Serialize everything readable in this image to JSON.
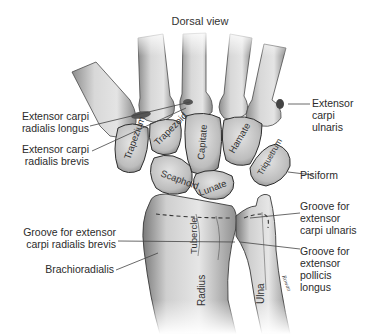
{
  "figure": {
    "title": "Dorsal view"
  },
  "labels_left": [
    {
      "id": "ecrl",
      "line1": "Extensor carpi",
      "line2": "radialis longus"
    },
    {
      "id": "ecrb",
      "line1": "Extensor carpi",
      "line2": "radialis brevis"
    },
    {
      "id": "groove_ecrb",
      "line1": "Groove for extensor",
      "line2": "carpi radialis brevis"
    },
    {
      "id": "brachioradialis",
      "line1": "Brachioradialis"
    }
  ],
  "labels_right": [
    {
      "id": "ecu",
      "line1": "Extensor",
      "line2": "carpi",
      "line3": "ulnaris"
    },
    {
      "id": "pisiform",
      "line1": "Pisiform"
    },
    {
      "id": "groove_ecu",
      "line1": "Groove for",
      "line2": "extensor",
      "line3": "carpi ulnaris"
    },
    {
      "id": "groove_epl",
      "line1": "Groove for",
      "line2": "extensor",
      "line3": "pollicis",
      "line4": "longus"
    }
  ],
  "bone_labels": {
    "trapezium": "Trapezium",
    "trapezoid": "Trapezoid",
    "capitate": "Capitate",
    "hamate": "Hamate",
    "triquetrum": "Triquetrum",
    "scaphoid": "Scaphoid",
    "lunate": "Lunate",
    "tubercle": "Tubercle",
    "radius": "Radius",
    "ulna": "Ulna"
  },
  "signature": "Rowan",
  "colors": {
    "bone_fill": "#d9d9d9",
    "bone_shade": "#9a9a9a",
    "outline": "#3a3a3a",
    "leader": "#444444"
  }
}
